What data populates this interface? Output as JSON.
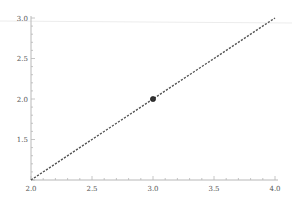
{
  "chart_data": {
    "type": "line",
    "title": "",
    "xlabel": "",
    "ylabel": "",
    "xlim": [
      2.0,
      4.0
    ],
    "ylim": [
      1.0,
      3.0
    ],
    "x_ticks": [
      "2.0",
      "2.5",
      "3.0",
      "3.5",
      "4.0"
    ],
    "y_ticks": [
      "1.5",
      "2.0",
      "2.5",
      "3.0"
    ],
    "grid": false,
    "legend": null,
    "series": [
      {
        "name": "line",
        "style": "dashed-dotted dark gray",
        "x": [
          2.0,
          2.5,
          3.0,
          3.5,
          4.0
        ],
        "y": [
          1.0,
          1.5,
          2.0,
          2.5,
          3.0
        ]
      }
    ],
    "points": [
      {
        "x": 3.0,
        "y": 2.0,
        "marker": "filled circle"
      }
    ]
  },
  "colors": {
    "axis": "#b8b8b8",
    "line": "#555555",
    "marker": "#333333",
    "tick_label": "#555555"
  }
}
